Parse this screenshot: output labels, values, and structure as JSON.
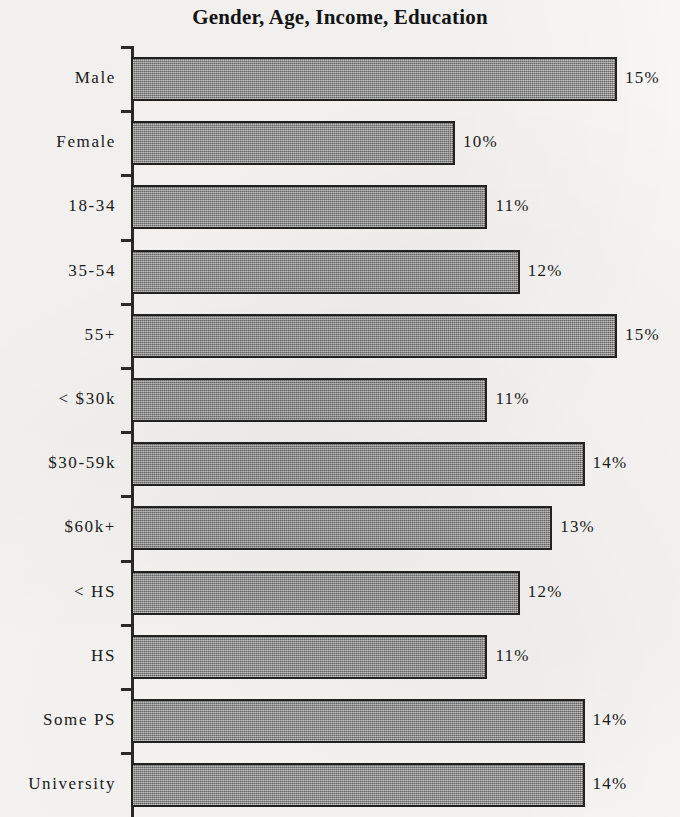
{
  "chart_data": {
    "type": "bar",
    "orientation": "horizontal",
    "title": "Gender, Age, Income, Education",
    "xlabel": "",
    "ylabel": "",
    "categories": [
      "Male",
      "Female",
      "18-34",
      "35-54",
      "55+",
      "< $30k",
      "$30-59k",
      "$60k+",
      "< HS",
      "HS",
      "Some PS",
      "University"
    ],
    "values": [
      15,
      10,
      11,
      12,
      15,
      11,
      14,
      13,
      12,
      11,
      14,
      14
    ],
    "value_labels": [
      "15%",
      "10%",
      "11%",
      "12%",
      "15%",
      "11%",
      "14%",
      "13%",
      "12%",
      "11%",
      "14%",
      "14%"
    ],
    "xlim": [
      0,
      17
    ],
    "grid": false,
    "legend": null,
    "bar_color": "#8d8d8d",
    "bar_border_color": "#222222",
    "axis_color": "#2a2a2a",
    "background_color": "#f7f6f4",
    "note": "Last bar (University) is clipped by the bottom edge of the image."
  }
}
